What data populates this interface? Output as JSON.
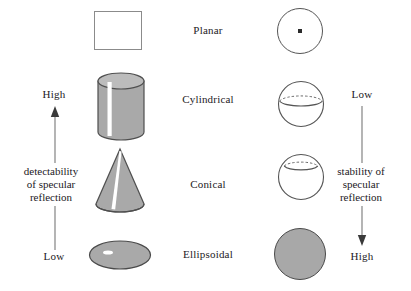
{
  "figure": {
    "title_present": false,
    "background_color": "#ffffff",
    "shape_fill_color": "#a8a8a8",
    "shape_stroke_color": "#555555",
    "highlight_color": "#ffffff",
    "text_color": "#23201e"
  },
  "left_axis": {
    "top_label": "High",
    "bottom_label": "Low",
    "caption_lines": [
      "detectability",
      "of specular",
      "reflection"
    ],
    "arrow_direction": "up"
  },
  "right_axis": {
    "top_label": "Low",
    "bottom_label": "High",
    "caption_lines": [
      "stability of",
      "specular",
      "reflection"
    ],
    "arrow_direction": "down"
  },
  "rows": [
    {
      "label": "Planar",
      "left_shape": "square-outline",
      "right_shape": "circle-with-center-dot"
    },
    {
      "label": "Cylindrical",
      "left_shape": "cylinder-with-stripe-highlight",
      "right_shape": "sphere-with-equator-band"
    },
    {
      "label": "Conical",
      "left_shape": "cone-with-stripe-highlight",
      "right_shape": "sphere-with-upper-band"
    },
    {
      "label": "Ellipsoidal",
      "left_shape": "ellipse-with-spot-highlight",
      "right_shape": "filled-circle"
    }
  ]
}
